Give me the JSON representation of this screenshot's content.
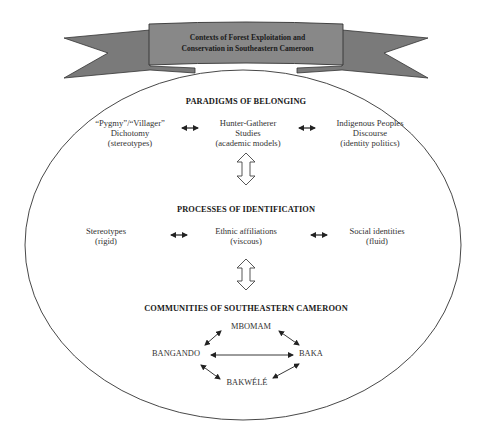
{
  "banner": {
    "title_line1": "Contexts of Forest Exploitation and",
    "title_line2": "Conservation in Southeastern Cameroon",
    "ribbon_color": "#7a7a7a",
    "panel_color": "#888888"
  },
  "paradigms": {
    "heading": "PARADIGMS OF BELONGING",
    "items": [
      {
        "line1": "“Pygmy”/“Villager”",
        "line2": "Dichotomy",
        "line3": "(stereotypes)"
      },
      {
        "line1": "Hunter-Gatherer",
        "line2": "Studies",
        "line3": "(academic models)"
      },
      {
        "line1": "Indigenous Peoples",
        "line2": "Discourse",
        "line3": "(identity politics)"
      }
    ]
  },
  "processes": {
    "heading": "PROCESSES OF IDENTIFICATION",
    "items": [
      {
        "line1": "Stereotypes",
        "line2": "(rigid)"
      },
      {
        "line1": "Ethnic affiliations",
        "line2": "(viscous)"
      },
      {
        "line1": "Social identities",
        "line2": "(fluid)"
      }
    ]
  },
  "communities": {
    "heading": "COMMUNITIES OF SOUTHEASTERN CAMEROON",
    "nodes": {
      "top": "MBOMAM",
      "left": "BANGANDO",
      "right": "BAKA",
      "bottom": "BAKWÉLÉ"
    }
  }
}
